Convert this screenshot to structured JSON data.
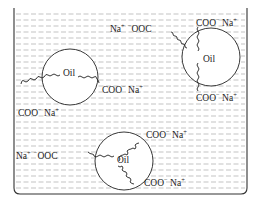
{
  "diagram": {
    "container": {
      "name": "water-container"
    },
    "micelles": [
      {
        "core_label": "Oil",
        "head_labels": [
          "COO− Na+",
          "COO− Na+"
        ],
        "text": {
          "core": "Oil",
          "head1_main": "COO",
          "head1_sup1": "−",
          "head1_na": " Na",
          "head1_sup2": "+",
          "head2_main": "COO",
          "head2_sup1": "−",
          "head2_na": " Na",
          "head2_sup2": "+"
        }
      },
      {
        "core_label": "Oil",
        "head_labels": [
          "Na+ −OOC",
          "COO− Na+",
          "COO− Na+"
        ],
        "text": {
          "core": "Oil",
          "left_na": "Na",
          "left_sup1": "+",
          "left_sup2": "−",
          "left_main": "OOC",
          "top_main": "COO",
          "top_sup1": "−",
          "top_na": " Na",
          "top_sup2": "+",
          "bottom_main": "COO",
          "bottom_sup1": "−",
          "bottom_na": " Na",
          "bottom_sup2": "+"
        }
      },
      {
        "core_label": "Oil",
        "head_labels": [
          "Na+ −OOC",
          "COO− Na+",
          "COO− Na+"
        ],
        "text": {
          "core": "Oil",
          "left_na": "Na",
          "left_sup1": "+",
          "left_sup2": "−",
          "left_main": "OOC",
          "top_main": "COO",
          "top_sup1": "−",
          "top_na": " Na",
          "top_sup2": "+",
          "bottom_main": "COO",
          "bottom_sup1": "−",
          "bottom_na": " Na",
          "bottom_sup2": "+"
        }
      }
    ],
    "colors": {
      "outline": "#222222",
      "water_dash": "#9a9a9a",
      "background": "#ffffff"
    }
  }
}
